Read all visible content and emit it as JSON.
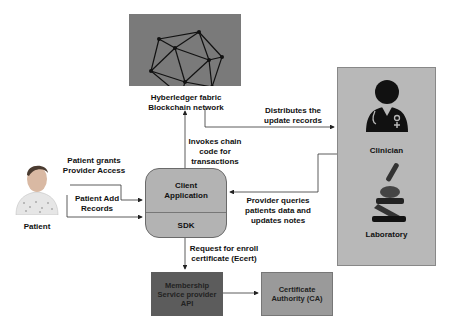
{
  "blockchain": {
    "label_line1": "Hyberledger fabric",
    "label_line2": "Blockchain network",
    "icon": "network-polyhedron-icon"
  },
  "client": {
    "label_line1": "Client",
    "label_line2": "Application",
    "sdk_label": "SDK"
  },
  "patient": {
    "label": "Patient",
    "icon": "patient-icon",
    "grants_line1": "Patient grants",
    "grants_line2": "Provider Access",
    "add_line1": "Patient Add",
    "add_line2": "Records"
  },
  "edges": {
    "invokes_line1": "Invokes chain",
    "invokes_line2": "code for",
    "invokes_line3": "transactions",
    "distributes_line1": "Distributes the",
    "distributes_line2": "update records",
    "queries_line1": "Provider queries",
    "queries_line2": "patients data and",
    "queries_line3": "updates notes",
    "request_line1": "Request for enroll",
    "request_line2": "certificate (Ecert)"
  },
  "providers": {
    "clinician_label": "Clinician",
    "clinician_icon": "doctor-icon",
    "laboratory_label": "Laboratory",
    "laboratory_icon": "microscope-icon"
  },
  "msp": {
    "line1": "Membership",
    "line2": "Service provider",
    "line3": "API"
  },
  "ca": {
    "line1": "Certificate",
    "line2": "Authority (CA)"
  }
}
